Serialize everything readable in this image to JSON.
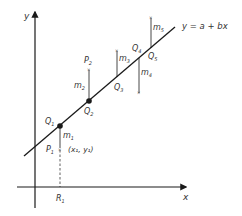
{
  "diagram": {
    "line_label": "y = a + bx",
    "axes": {
      "x_label": "x",
      "y_label": "y"
    },
    "points": [
      {
        "P": "P",
        "P_sub": "1",
        "Q": "Q",
        "Q_sub": "1",
        "m": "m",
        "m_sub": "1",
        "coord_label": "(x₁, y₁)",
        "R": "R",
        "R_sub": "1"
      },
      {
        "P": "P",
        "P_sub": "2",
        "Q": "Q",
        "Q_sub": "2",
        "m": "m",
        "m_sub": "2"
      },
      {
        "Q": "Q",
        "Q_sub": "3",
        "m": "m",
        "m_sub": "3"
      },
      {
        "Q": "Q",
        "Q_sub": "4",
        "m": "m",
        "m_sub": "4"
      },
      {
        "Q": "Q",
        "Q_sub": "5",
        "m": "m",
        "m_sub": "5"
      }
    ],
    "colors": {
      "ink": "#1a1a1a",
      "label": "#333333",
      "background": "#ffffff"
    }
  }
}
